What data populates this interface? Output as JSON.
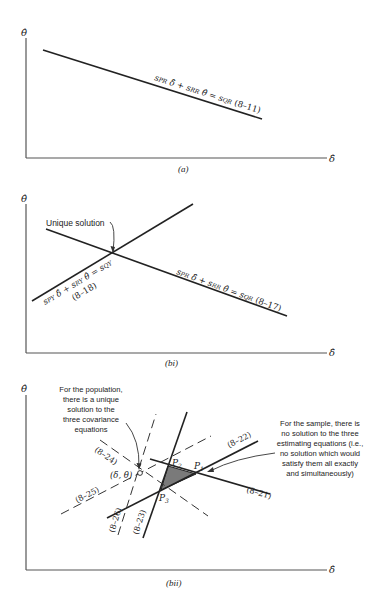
{
  "axes": {
    "y_label": "θ̂",
    "x_label": "δ̂"
  },
  "panel_a": {
    "caption": "(a)",
    "equation": {
      "t1": "s",
      "s1": "PR",
      "v1": " δ̂ + ",
      "t2": "s",
      "s2": "RR",
      "v2": " θ̂ = ",
      "t3": "s",
      "s3": "QR",
      "ref": " (8–11)"
    }
  },
  "panel_bi": {
    "caption": "(bi)",
    "annotation": "Unique solution",
    "equation_1": {
      "t1": "s",
      "s1": "PR",
      "v1": " δ̂ + ",
      "t2": "s",
      "s2": "RR",
      "v2": " θ̂ = ",
      "t3": "s",
      "s3": "QR",
      "ref": " (8–17)"
    },
    "equation_2": {
      "t1": "s",
      "s1": "PY",
      "v1": " δ̂ + ",
      "t2": "s",
      "s2": "RY",
      "v2": " θ̂ = ",
      "t3": "s",
      "s3": "QY",
      "ref": "(8–18)"
    }
  },
  "panel_bii": {
    "caption": "(bii)",
    "population_note": [
      "For the population,",
      "there is a unique",
      "solution to the",
      "three covariance",
      "equations"
    ],
    "sample_note": [
      "For the sample, there is",
      "no solution to the three",
      "estimating equations (i.e.,",
      "no solution which would",
      "satisfy them all exactly",
      "and simultaneously)"
    ],
    "point_label": "(δ, θ)",
    "vertices": {
      "p1": "P",
      "p1_sub": "1",
      "p2": "P",
      "p2_sub": "2",
      "p3": "P",
      "p3_sub": "3"
    },
    "line_labels": {
      "l21": "(8–21)",
      "l22": "(8–22)",
      "l23": "(8–23)",
      "l24": "(8–24)",
      "l25": "(8–25)",
      "l26": "(8–26)"
    },
    "shade_color": "#7a7a7a"
  }
}
